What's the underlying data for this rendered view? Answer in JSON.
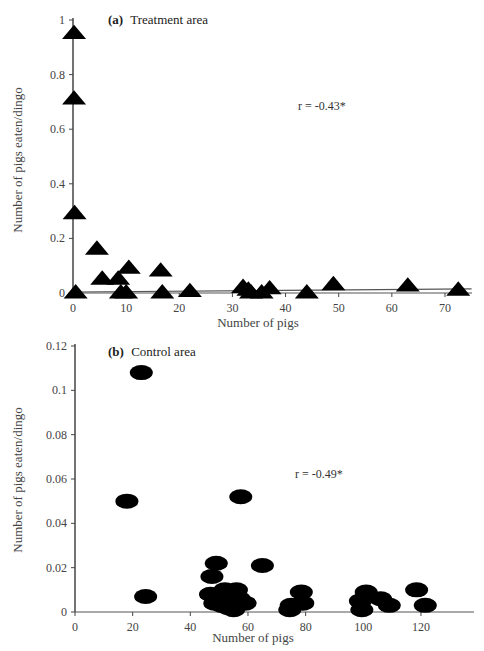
{
  "chart_data": [
    {
      "type": "scatter",
      "panel": "a",
      "title": "Treatment area",
      "panel_letter": "(a)",
      "xlabel": "Number of pigs",
      "ylabel": "Number of pigs eaten/dingo",
      "xlim": [
        0,
        75
      ],
      "ylim": [
        0,
        1
      ],
      "xticks": [
        0,
        10,
        20,
        30,
        40,
        50,
        60,
        70
      ],
      "yticks": [
        0,
        0.2,
        0.4,
        0.6,
        0.8,
        1
      ],
      "ytick_labels": [
        "0",
        "0.2",
        "0.4",
        "0.6",
        "0.8",
        "1"
      ],
      "marker": "triangle",
      "annotation": "r = -0.43*",
      "trend_line": {
        "x": [
          0,
          75
        ],
        "y": [
          0.0,
          0.015
        ]
      },
      "grid": false,
      "points": [
        {
          "x": 0.2,
          "y": 0.95
        },
        {
          "x": 0.2,
          "y": 0.71
        },
        {
          "x": 0.3,
          "y": 0.29
        },
        {
          "x": 0.5,
          "y": 0.0
        },
        {
          "x": 4.5,
          "y": 0.16
        },
        {
          "x": 5.5,
          "y": 0.05
        },
        {
          "x": 8.5,
          "y": 0.05
        },
        {
          "x": 10.5,
          "y": 0.09
        },
        {
          "x": 9.0,
          "y": 0.0
        },
        {
          "x": 10.0,
          "y": 0.0
        },
        {
          "x": 16.5,
          "y": 0.08
        },
        {
          "x": 16.8,
          "y": 0.0
        },
        {
          "x": 22.0,
          "y": 0.005
        },
        {
          "x": 32.0,
          "y": 0.02
        },
        {
          "x": 33.0,
          "y": 0.01
        },
        {
          "x": 33.5,
          "y": 0.0
        },
        {
          "x": 35.5,
          "y": 0.0
        },
        {
          "x": 37.0,
          "y": 0.015
        },
        {
          "x": 44.0,
          "y": 0.0
        },
        {
          "x": 49.0,
          "y": 0.03
        },
        {
          "x": 63.0,
          "y": 0.025
        },
        {
          "x": 72.5,
          "y": 0.01
        }
      ]
    },
    {
      "type": "scatter",
      "panel": "b",
      "title": "Control area",
      "panel_letter": "(b)",
      "xlabel": "Number of pigs",
      "ylabel": "Number of pigs eaten/dingo",
      "xlim": [
        0,
        130
      ],
      "ylim": [
        0,
        0.12
      ],
      "xticks": [
        0,
        20,
        40,
        60,
        80,
        100,
        120
      ],
      "yticks": [
        0,
        0.02,
        0.04,
        0.06,
        0.08,
        0.1,
        0.12
      ],
      "ytick_labels": [
        "0",
        "0.02",
        "0.04",
        "0.06",
        "0.08",
        "0.1",
        "0.12"
      ],
      "marker": "ellipse",
      "annotation": "r = -0.49*",
      "grid": false,
      "points": [
        {
          "x": 23,
          "y": 0.108
        },
        {
          "x": 18,
          "y": 0.05
        },
        {
          "x": 24.5,
          "y": 0.007
        },
        {
          "x": 57.5,
          "y": 0.052
        },
        {
          "x": 49,
          "y": 0.022
        },
        {
          "x": 47.5,
          "y": 0.016
        },
        {
          "x": 65,
          "y": 0.021
        },
        {
          "x": 47,
          "y": 0.008
        },
        {
          "x": 50,
          "y": 0.006
        },
        {
          "x": 52,
          "y": 0.01
        },
        {
          "x": 54,
          "y": 0.008
        },
        {
          "x": 56,
          "y": 0.01
        },
        {
          "x": 48.5,
          "y": 0.004
        },
        {
          "x": 51,
          "y": 0.003
        },
        {
          "x": 53,
          "y": 0.002
        },
        {
          "x": 55,
          "y": 0.001
        },
        {
          "x": 57,
          "y": 0.006
        },
        {
          "x": 59,
          "y": 0.004
        },
        {
          "x": 78.5,
          "y": 0.009
        },
        {
          "x": 75,
          "y": 0.003
        },
        {
          "x": 79,
          "y": 0.004
        },
        {
          "x": 74.5,
          "y": 0.001
        },
        {
          "x": 101,
          "y": 0.009
        },
        {
          "x": 99,
          "y": 0.005
        },
        {
          "x": 106,
          "y": 0.006
        },
        {
          "x": 99.5,
          "y": 0.001
        },
        {
          "x": 109,
          "y": 0.003
        },
        {
          "x": 118.5,
          "y": 0.01
        },
        {
          "x": 121.5,
          "y": 0.003
        }
      ]
    }
  ],
  "panels": {
    "a": {
      "letter": "(a)",
      "title": "Treatment area",
      "r_value": "r = -0.43*",
      "xlabel": "Number of pigs",
      "ylabel": "Number of pigs eaten/dingo"
    },
    "b": {
      "letter": "(b)",
      "title": "Control area",
      "r_value": "r = -0.49*",
      "xlabel": "Number of pigs",
      "ylabel": "Number of pigs eaten/dingo"
    }
  }
}
